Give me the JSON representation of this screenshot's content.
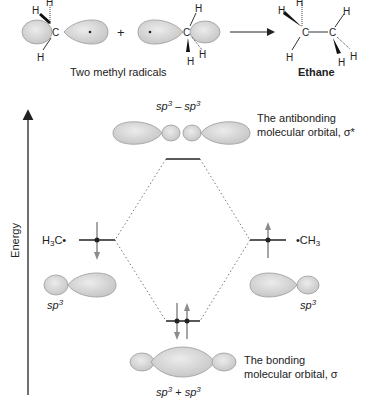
{
  "reaction": {
    "reactant_label": "Two methyl radicals",
    "product_label": "Ethane",
    "plus": "+",
    "atoms": {
      "H": "H",
      "C": "C"
    }
  },
  "diagram": {
    "axis_label": "Energy",
    "antibonding": {
      "combo": {
        "a": "sp",
        "a_sup": "3",
        "op": " – ",
        "b": "sp",
        "b_sup": "3"
      },
      "label_line1": "The antibonding",
      "label_line2": "molecular orbital, σ*"
    },
    "bonding": {
      "combo": {
        "a": "sp",
        "a_sup": "3",
        "op": " + ",
        "b": "sp",
        "b_sup": "3"
      },
      "label_line1": "The bonding",
      "label_line2": "molecular orbital, σ"
    },
    "left_fragment": {
      "prefix": "H",
      "sub": "3",
      "suffix": "C•"
    },
    "right_fragment": {
      "prefix": "•CH",
      "sub": "3"
    },
    "left_orbital": {
      "a": "sp",
      "sup": "3"
    },
    "right_orbital": {
      "a": "sp",
      "sup": "3"
    }
  },
  "colors": {
    "orbital_fill": "#d4d4d4",
    "orbital_stroke": "#9a9a9a",
    "electron_arrow": "#8a8a8a",
    "level_line": "#222222",
    "dotted": "#777777"
  }
}
